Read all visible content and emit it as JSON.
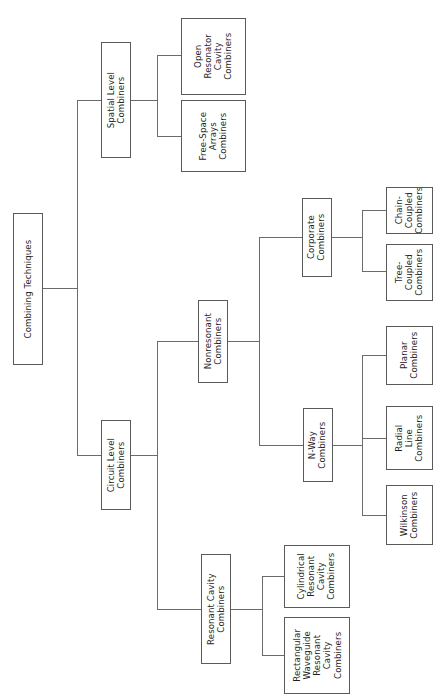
{
  "diagram": {
    "title": "Combining Techniques",
    "type": "tree",
    "orientation": "left-to-right, rotated text (bottom-to-top)",
    "colors": {
      "background": "#ffffff",
      "box_border": "#5a5a5a",
      "connector": "#6b6b6b",
      "text": "#1f1f1f"
    },
    "nodes": {
      "root": {
        "label": "Combining Techniques"
      },
      "spatial_level": {
        "label": "Spatial Level\nCombiners"
      },
      "open_resonator": {
        "label": "Open\nResonator\nCavity\nCombiners"
      },
      "free_space": {
        "label": "Free-Space\nArrays\nCombiners"
      },
      "circuit_level": {
        "label": "Circuit Level\nCombiners"
      },
      "nonresonant": {
        "label": "Nonresonant\nCombiners"
      },
      "resonant_cavity": {
        "label": "Resonant Cavity\nCombiners"
      },
      "corporate": {
        "label": "Corporate\nCombiners"
      },
      "n_way": {
        "label": "N-Way\nCombiners"
      },
      "chain_coupled": {
        "label": "Chain-\nCoupled\nCombiners"
      },
      "tree_coupled": {
        "label": "Tree-\nCoupled\nCombiners"
      },
      "planar": {
        "label": "Planar\nCombiners"
      },
      "radial_line": {
        "label": "Radial\nLine\nCombiners"
      },
      "wilkinson": {
        "label": "Wilkinson\nCombiners"
      },
      "cylindrical_resonant": {
        "label": "Cylindrical\nResonant\nCavity\nCombiners"
      },
      "rectangular_waveguide": {
        "label": "Rectangular\nWaveguide\nResonant\nCavity\nCombiners"
      }
    },
    "edges": [
      {
        "from": "root",
        "to": "spatial_level"
      },
      {
        "from": "root",
        "to": "circuit_level"
      },
      {
        "from": "spatial_level",
        "to": "open_resonator"
      },
      {
        "from": "spatial_level",
        "to": "free_space"
      },
      {
        "from": "circuit_level",
        "to": "nonresonant"
      },
      {
        "from": "circuit_level",
        "to": "resonant_cavity"
      },
      {
        "from": "nonresonant",
        "to": "corporate"
      },
      {
        "from": "nonresonant",
        "to": "n_way"
      },
      {
        "from": "corporate",
        "to": "chain_coupled"
      },
      {
        "from": "corporate",
        "to": "tree_coupled"
      },
      {
        "from": "n_way",
        "to": "planar"
      },
      {
        "from": "n_way",
        "to": "radial_line"
      },
      {
        "from": "n_way",
        "to": "wilkinson"
      },
      {
        "from": "resonant_cavity",
        "to": "cylindrical_resonant"
      },
      {
        "from": "resonant_cavity",
        "to": "rectangular_waveguide"
      }
    ]
  }
}
